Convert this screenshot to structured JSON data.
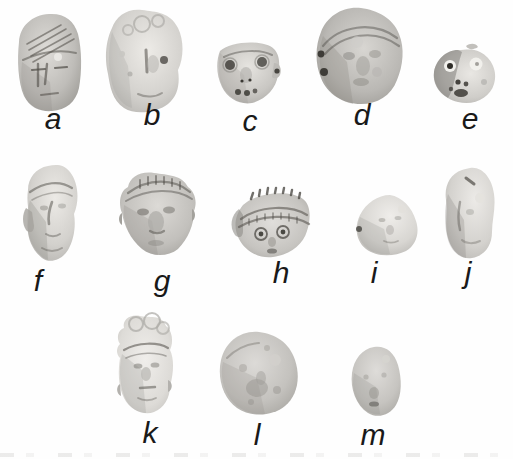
{
  "figure": {
    "kind": "photographic-plate",
    "colors": {
      "background": "#fefefe",
      "label_text": "#191919",
      "clay_highlight": "#ebe9e5",
      "clay_mid": "#c6c4c0",
      "clay_shadow": "#8f8d88",
      "feature_dark": "#3a3833"
    },
    "items": [
      {
        "id": "a",
        "label": "a",
        "alt": "figurine head with incised striped cap"
      },
      {
        "id": "b",
        "label": "b",
        "alt": "figurine head with lumpy curled coiffure"
      },
      {
        "id": "c",
        "label": "c",
        "alt": "figurine face with punched eyes and open mouth"
      },
      {
        "id": "d",
        "label": "d",
        "alt": "large round figurine head with headband"
      },
      {
        "id": "e",
        "label": "e",
        "alt": "small figurine head with ringed eyes"
      },
      {
        "id": "f",
        "label": "f",
        "alt": "narrow figurine head with cap and ear flap"
      },
      {
        "id": "g",
        "label": "g",
        "alt": "wide figurine head with notched cap band"
      },
      {
        "id": "h",
        "label": "h",
        "alt": "figurine head with elaborate notched headdress"
      },
      {
        "id": "i",
        "label": "i",
        "alt": "small worn figurine head"
      },
      {
        "id": "j",
        "label": "j",
        "alt": "tall worn figurine head"
      },
      {
        "id": "k",
        "label": "k",
        "alt": "tall figurine head with stacked crown"
      },
      {
        "id": "l",
        "label": "l",
        "alt": "round worn figurine head"
      },
      {
        "id": "m",
        "label": "m",
        "alt": "small oval worn figurine head"
      }
    ]
  }
}
